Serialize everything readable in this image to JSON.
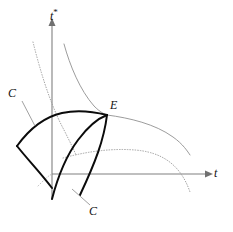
{
  "figure": {
    "type": "diagram",
    "title": "",
    "background_color": "#ffffff"
  },
  "axes": {
    "horizontal": {
      "label": "t",
      "name": "t-axis",
      "color": "#808080",
      "origin_px": [
        52,
        174
      ],
      "end_px": [
        208,
        174
      ],
      "arrow": true
    },
    "vertical": {
      "label_base": "t",
      "label_sup": "*",
      "label": "t*",
      "name": "t-star-axis",
      "color": "#808080",
      "origin_px": [
        52,
        174
      ],
      "end_px": [
        52,
        22
      ],
      "extends_below_origin_to_px": [
        52,
        200
      ],
      "arrow": true
    }
  },
  "points": [
    {
      "label": "E",
      "name": "point-E",
      "px": [
        105,
        114
      ],
      "description": "equilibrium intersection point"
    }
  ],
  "curve_labels": [
    {
      "label": "C",
      "name": "curve-label-C-upper-left",
      "px": [
        12,
        92
      ],
      "leader_to_px": [
        33,
        124
      ]
    },
    {
      "label": "C",
      "name": "curve-label-C-lower",
      "px": [
        93,
        210
      ],
      "leader_to_px": [
        70,
        190
      ]
    }
  ],
  "curves": [
    {
      "name": "bold-reaction-curve-home",
      "style": "solid-bold",
      "color": "#0b0b0b",
      "path": "M 17,146 C 30,128 44,117 62,113 C 80,109 95,112 107,115"
    },
    {
      "name": "bold-reaction-curve-foreign",
      "style": "solid-bold",
      "color": "#0b0b0b",
      "path": "M 52,199 C 58,176 66,156 78,140 C 90,124 99,118 107,115"
    },
    {
      "name": "bold-segment-lower-left",
      "style": "solid-bold",
      "color": "#0b0b0b",
      "path": "M 17,146 C 28,160 40,172 52,188"
    },
    {
      "name": "bold-segment-lower-right",
      "style": "solid-bold",
      "color": "#0b0b0b",
      "path": "M 107,115 C 104,140 95,163 80,195"
    },
    {
      "name": "thin-iso-curve-upper",
      "style": "solid-thin",
      "color": "#8a8a8a",
      "path": "M 64,44 C 70,66 80,90 94,106 C 100,112 104,114 107,115"
    },
    {
      "name": "thin-iso-curve-right",
      "style": "solid-thin",
      "color": "#8a8a8a",
      "path": "M 107,115 C 130,118 155,124 173,137 C 183,144 188,152 190,155"
    },
    {
      "name": "dotted-iso-curve-upper-left",
      "style": "dotted",
      "color": "#9a9a9a",
      "path": "M 33,42 C 40,70 50,104 64,130 C 70,142 74,150 76,155"
    },
    {
      "name": "dotted-iso-curve-lower-right",
      "style": "dotted",
      "color": "#9a9a9a",
      "path": "M 63,158 C 85,152 110,148 135,150 C 160,152 180,163 190,192"
    },
    {
      "name": "dotted-segment-origin",
      "style": "dotted-faint",
      "color": "#b0b0b0",
      "path": "M 38,186 C 44,180 48,176 52,174"
    }
  ]
}
